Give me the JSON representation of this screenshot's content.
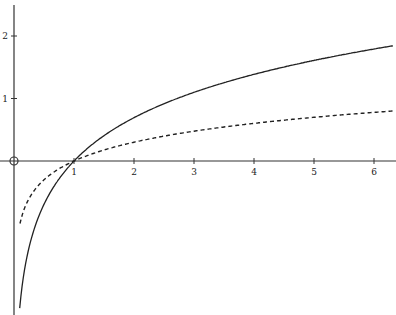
{
  "chart_data": {
    "type": "line",
    "title": "",
    "xlabel": "",
    "ylabel": "",
    "xlim": [
      0,
      6.4
    ],
    "ylim": [
      -2.4,
      2.5
    ],
    "x_ticks": [
      "1",
      "2",
      "3",
      "4",
      "5",
      "6"
    ],
    "y_ticks": [
      "1",
      "2"
    ],
    "origin_marker": "circle",
    "grid": false,
    "legend": null,
    "series": [
      {
        "name": "ln x",
        "style": "solid",
        "x": [
          0.1,
          0.2,
          0.3,
          0.5,
          0.75,
          1,
          1.5,
          2,
          2.5,
          3,
          3.5,
          4,
          4.5,
          5,
          5.5,
          6,
          6.3
        ],
        "values": [
          -2.3,
          -1.61,
          -1.2,
          -0.69,
          -0.29,
          0,
          0.41,
          0.69,
          0.92,
          1.1,
          1.25,
          1.39,
          1.5,
          1.61,
          1.7,
          1.79,
          1.84
        ]
      },
      {
        "name": "log10 x",
        "style": "dashed",
        "x": [
          0.1,
          0.2,
          0.3,
          0.5,
          0.75,
          1,
          1.5,
          2,
          2.5,
          3,
          3.5,
          4,
          4.5,
          5,
          5.5,
          6,
          6.3
        ],
        "values": [
          -1.0,
          -0.7,
          -0.52,
          -0.3,
          -0.12,
          0,
          0.18,
          0.3,
          0.4,
          0.48,
          0.54,
          0.6,
          0.65,
          0.7,
          0.74,
          0.78,
          0.8
        ]
      }
    ]
  }
}
